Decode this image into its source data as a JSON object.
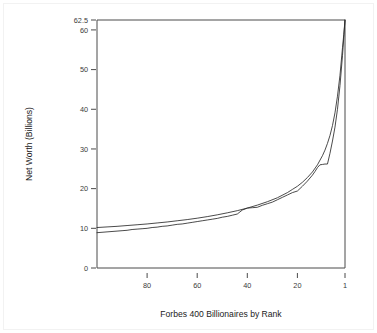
{
  "chart_data": {
    "type": "line",
    "title": "",
    "xlabel": "Forbes 400 Billionaires by Rank",
    "ylabel": "Net Worth (Billions)",
    "xlim": [
      100,
      1
    ],
    "ylim": [
      0,
      62.5
    ],
    "x_reversed": true,
    "grid": false,
    "legend": "none",
    "xticks": [
      80,
      60,
      40,
      20,
      1
    ],
    "xtick_labels": [
      "80",
      "60",
      "40",
      "20",
      "1"
    ],
    "yticks": [
      0,
      10,
      20,
      30,
      40,
      50,
      60,
      62.5
    ],
    "ytick_labels": [
      "0",
      "10",
      "20",
      "30",
      "40",
      "50",
      "60",
      "62.5"
    ],
    "series": [
      {
        "name": "Net worth by rank (data)",
        "x": [
          100,
          98,
          96,
          94,
          92,
          90,
          88,
          86,
          84,
          82,
          80,
          78,
          76,
          74,
          72,
          70,
          68,
          66,
          64,
          62,
          60,
          58,
          56,
          54,
          52,
          50,
          48,
          46,
          44,
          42,
          40,
          38,
          36,
          34,
          32,
          30,
          28,
          26,
          24,
          22,
          20,
          18,
          16,
          14,
          13,
          12,
          11,
          10,
          9,
          8,
          7,
          6,
          5,
          4,
          3,
          2,
          1
        ],
        "values": [
          8.9,
          9.0,
          9.1,
          9.2,
          9.3,
          9.4,
          9.5,
          9.7,
          9.8,
          9.9,
          10.0,
          10.2,
          10.3,
          10.5,
          10.6,
          10.8,
          11.0,
          11.1,
          11.3,
          11.5,
          11.7,
          11.9,
          12.1,
          12.3,
          12.5,
          12.8,
          13.0,
          13.3,
          13.6,
          14.6,
          15.1,
          15.2,
          15.3,
          15.8,
          16.2,
          16.6,
          17.2,
          17.8,
          18.4,
          19.0,
          19.4,
          20.6,
          21.9,
          23.4,
          24.3,
          25.3,
          26.0,
          26.1,
          26.2,
          26.2,
          28.9,
          32.0,
          35.5,
          40.0,
          46.0,
          53.5,
          62.5
        ]
      },
      {
        "name": "Power-law fit",
        "x": [
          100,
          96,
          92,
          88,
          84,
          80,
          76,
          72,
          68,
          64,
          60,
          56,
          52,
          48,
          44,
          40,
          36,
          32,
          28,
          24,
          22,
          20,
          18,
          16,
          14,
          12,
          10,
          9,
          8,
          7,
          6,
          5,
          4,
          3,
          2,
          1.5,
          1
        ],
        "values": [
          10.2,
          10.35,
          10.5,
          10.7,
          10.9,
          11.1,
          11.35,
          11.6,
          11.9,
          12.2,
          12.55,
          12.95,
          13.4,
          13.9,
          14.45,
          15.1,
          15.85,
          16.7,
          17.7,
          19.0,
          19.8,
          20.6,
          21.6,
          22.8,
          24.2,
          26.0,
          28.3,
          29.7,
          31.4,
          33.4,
          35.9,
          39.1,
          43.3,
          48.6,
          55.5,
          58.8,
          62.5
        ]
      }
    ]
  }
}
